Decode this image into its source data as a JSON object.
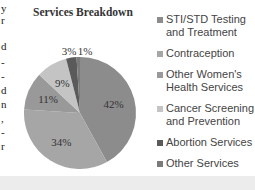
{
  "left_edge_fragments": [
    "y",
    "r",
    "d",
    "-",
    "-",
    "d",
    "n",
    ",",
    "-",
    "r"
  ],
  "chart_data": {
    "type": "pie",
    "title": "Services Breakdown",
    "categories": [
      "STI/STD Testing and Treatment",
      "Contraception",
      "Other Women's Health Services",
      "Cancer Screening and Prevention",
      "Abortion Services",
      "Other Services"
    ],
    "values": [
      42,
      34,
      11,
      9,
      3,
      1
    ],
    "labels": [
      "42%",
      "34%",
      "11%",
      "9%",
      "3%",
      "1%"
    ],
    "colors": [
      "#8c8c8c",
      "#a6a6a6",
      "#999999",
      "#c4c4c4",
      "#5a5a5a",
      "#7a7a7a"
    ],
    "legend_placement": "right",
    "start": "top",
    "direction": "clockwise"
  },
  "legend": [
    {
      "line1": "STI/STD Testing",
      "line2": "and Treatment"
    },
    {
      "line1": "Contraception",
      "line2": ""
    },
    {
      "line1": "Other Women's",
      "line2": "Health Services"
    },
    {
      "line1": "Cancer Screening",
      "line2": "and Prevention"
    },
    {
      "line1": "Abortion Services",
      "line2": ""
    },
    {
      "line1": "Other Services",
      "line2": ""
    }
  ]
}
